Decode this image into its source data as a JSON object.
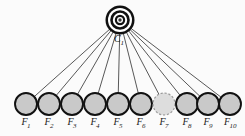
{
  "figure": {
    "background_color": "#fbfbfb",
    "cluster": {
      "id": "C1",
      "label": "C",
      "subscript": "1",
      "shape": "bullseye-target",
      "cx": 120,
      "cy": 20,
      "rings": [
        {
          "r": 14.5,
          "fill": "#111111"
        },
        {
          "r": 12.0,
          "fill": "#ffffff"
        },
        {
          "r": 9.8,
          "fill": "#111111"
        },
        {
          "r": 7.2,
          "fill": "#ffffff"
        },
        {
          "r": 5.2,
          "fill": "#111111"
        },
        {
          "r": 3.0,
          "fill": "#ffffff"
        },
        {
          "r": 1.7,
          "fill": "#3a3a3a"
        }
      ],
      "label_x": 114,
      "label_y": 42
    },
    "leaves": [
      {
        "id": "F1",
        "label": "F",
        "subscript": "1",
        "cx": 26,
        "cy": 104,
        "r": 11,
        "fill": "#c9c9c9",
        "dashed": false
      },
      {
        "id": "F2",
        "label": "F",
        "subscript": "2",
        "cx": 49,
        "cy": 104,
        "r": 11,
        "fill": "#c9c9c9",
        "dashed": false
      },
      {
        "id": "F3",
        "label": "F",
        "subscript": "3",
        "cx": 72,
        "cy": 104,
        "r": 11,
        "fill": "#c9c9c9",
        "dashed": false
      },
      {
        "id": "F4",
        "label": "F",
        "subscript": "4",
        "cx": 95,
        "cy": 104,
        "r": 11,
        "fill": "#c9c9c9",
        "dashed": false
      },
      {
        "id": "F5",
        "label": "F",
        "subscript": "5",
        "cx": 118,
        "cy": 104,
        "r": 11,
        "fill": "#c9c9c9",
        "dashed": false
      },
      {
        "id": "F6",
        "label": "F",
        "subscript": "6",
        "cx": 141,
        "cy": 104,
        "r": 11,
        "fill": "#c9c9c9",
        "dashed": false
      },
      {
        "id": "F7",
        "label": "F",
        "subscript": "7",
        "cx": 164,
        "cy": 104,
        "r": 11,
        "fill": "#dddddd",
        "dashed": true
      },
      {
        "id": "F8",
        "label": "F",
        "subscript": "8",
        "cx": 187,
        "cy": 104,
        "r": 11,
        "fill": "#c9c9c9",
        "dashed": false
      },
      {
        "id": "F9",
        "label": "F",
        "subscript": "9",
        "cx": 208,
        "cy": 104,
        "r": 11,
        "fill": "#c9c9c9",
        "dashed": false
      },
      {
        "id": "F10",
        "label": "F",
        "subscript": "10",
        "cx": 230,
        "cy": 104,
        "r": 11,
        "fill": "#c9c9c9",
        "dashed": false
      }
    ],
    "edges": [
      {
        "from": "C1",
        "to": "F1"
      },
      {
        "from": "C1",
        "to": "F2"
      },
      {
        "from": "C1",
        "to": "F3"
      },
      {
        "from": "C1",
        "to": "F4"
      },
      {
        "from": "C1",
        "to": "F5"
      },
      {
        "from": "C1",
        "to": "F6"
      },
      {
        "from": "C1",
        "to": "F7"
      },
      {
        "from": "C1",
        "to": "F8"
      },
      {
        "from": "C1",
        "to": "F9"
      },
      {
        "from": "C1",
        "to": "F10"
      }
    ],
    "edge_color": "#3a3a3a",
    "node_stroke": "#111111",
    "label_color": "#1a1a1a"
  }
}
